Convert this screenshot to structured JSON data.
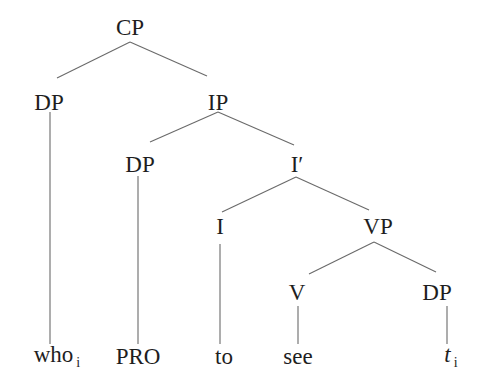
{
  "diagram": {
    "type": "syntax-tree",
    "line_color": "#6a6a6a",
    "text_color": "#1e1e1e",
    "nodes": {
      "cp": {
        "label": "CP",
        "x": 130,
        "y": 27
      },
      "dp_who": {
        "label": "DP",
        "x": 49,
        "y": 102
      },
      "ip": {
        "label": "IP",
        "x": 218,
        "y": 102
      },
      "dp_pro": {
        "label": "DP",
        "x": 140,
        "y": 164
      },
      "i_bar": {
        "label": "I′",
        "x": 297,
        "y": 164
      },
      "i": {
        "label": "I",
        "x": 220,
        "y": 226
      },
      "vp": {
        "label": "VP",
        "x": 378,
        "y": 226
      },
      "v": {
        "label": "V",
        "x": 297,
        "y": 292
      },
      "dp_trace": {
        "label": "DP",
        "x": 437,
        "y": 292
      }
    },
    "leaves": {
      "who": {
        "word": "who",
        "subscript": "i",
        "x": 52,
        "y": 356
      },
      "pro": {
        "word": "PRO",
        "x": 138,
        "y": 356
      },
      "to": {
        "word": "to",
        "x": 224,
        "y": 356
      },
      "see": {
        "word": "see",
        "x": 298,
        "y": 356
      },
      "trace": {
        "word": "t",
        "subscript": "i",
        "x": 450,
        "y": 356
      }
    }
  }
}
